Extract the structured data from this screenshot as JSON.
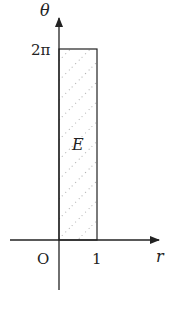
{
  "diagram": {
    "axes": {
      "horizontal_label": "r",
      "vertical_label": "θ",
      "origin_label": "O"
    },
    "ticks": {
      "r_tick": "1",
      "theta_tick": "2π"
    },
    "region": {
      "label": "E",
      "r_range": [
        0,
        1
      ],
      "theta_range": [
        0,
        "2π"
      ],
      "fill": "dotted diagonal hatch"
    },
    "colors": {
      "stroke": "#222222",
      "hatch": "#888888",
      "background": "#ffffff"
    }
  }
}
